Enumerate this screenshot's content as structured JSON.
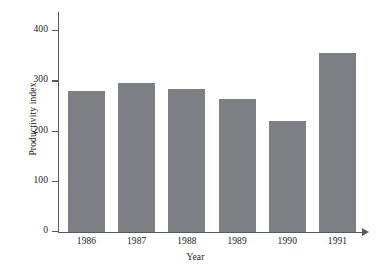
{
  "chart_data": {
    "type": "bar",
    "title": "",
    "xlabel": "Year",
    "ylabel": "Productivity index",
    "categories": [
      "1986",
      "1987",
      "1988",
      "1989",
      "1990",
      "1991"
    ],
    "values": [
      280,
      295,
      285,
      265,
      220,
      356
    ],
    "ylim": [
      0,
      420
    ],
    "yticks": [
      0,
      100,
      200,
      300,
      400
    ],
    "ytick_labels": [
      "0",
      "100",
      "200",
      "300",
      "400"
    ],
    "grid": false,
    "legend": null,
    "bar_color": "#7e8083",
    "axis_color": "#555a5e",
    "background_color": "#ffffff",
    "x_axis_arrow": true
  }
}
